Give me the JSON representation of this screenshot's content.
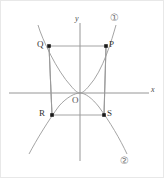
{
  "figure": {
    "width": 164,
    "height": 178,
    "background": "#ffffff",
    "border_color": "#e8e8e8"
  },
  "axes": {
    "x_label": "x",
    "y_label": "y",
    "origin_label": "O",
    "axis_color": "#8a8a8a",
    "x_line": {
      "x1": 8,
      "y1": 92,
      "x2": 148,
      "y2": 92
    },
    "y_line": {
      "x1": 79,
      "y1": 22,
      "x2": 79,
      "y2": 160
    },
    "x_label_pos": {
      "x": 150,
      "y": 87
    },
    "y_label_pos": {
      "x": 74,
      "y": 15
    },
    "origin_label_pos": {
      "x": 72,
      "y": 95
    }
  },
  "points": [
    {
      "name": "Q",
      "label": "Q",
      "x": 48,
      "y": 45,
      "label_x": 37,
      "label_y": 39
    },
    {
      "name": "P",
      "label": "P",
      "x": 105,
      "y": 45,
      "label_x": 108,
      "label_y": 39
    },
    {
      "name": "R",
      "label": "R",
      "x": 51,
      "y": 114,
      "label_x": 39,
      "label_y": 108
    },
    {
      "name": "S",
      "label": "S",
      "x": 103,
      "y": 114,
      "label_x": 106,
      "label_y": 108
    }
  ],
  "rectangle": {
    "name": "rectangle-QPSR",
    "stroke": "#9a9a9a",
    "vertices": "48,45 105,45 103,114 51,114"
  },
  "curves": [
    {
      "id": "1",
      "label": "①",
      "description": "upward parabola through Q, O, P",
      "stroke": "#9a9a9a",
      "label_x": 110,
      "label_y": 13,
      "path": "M 37,24 Q 40,32 48,45 Q 60,68 70,85 Q 76,91 79,92 Q 82,91 88,85 Q 98,68 105,45 Q 112,32 115,24"
    },
    {
      "id": "2",
      "label": "②",
      "description": "downward parabola through R, O, S",
      "stroke": "#9a9a9a",
      "label_x": 120,
      "label_y": 156,
      "path": "M 28,153 Q 38,134 51,114 Q 64,97 72,93 Q 76,92 79,92 Q 82,92 86,95 Q 95,102 103,114 Q 116,134 126,153"
    }
  ],
  "drop_lines": [
    {
      "name": "vertical-through-Q-R",
      "x1": 48,
      "y1": 45,
      "x2": 51,
      "y2": 114
    },
    {
      "name": "vertical-through-P-S",
      "x1": 105,
      "y1": 45,
      "x2": 103,
      "y2": 114
    }
  ],
  "colors": {
    "curve": "#9a9a9a",
    "axis": "#8a8a8a",
    "point": "#1a1a1a",
    "text": "#333333"
  }
}
